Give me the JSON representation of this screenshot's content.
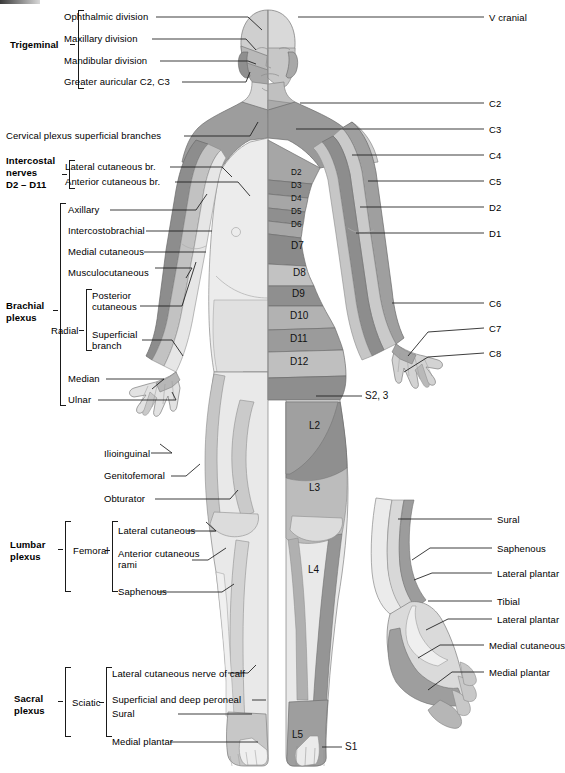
{
  "figure": {
    "colors": {
      "ink": "#1a1a1a",
      "skin_light": "#eeeeee",
      "tone1": "#e3e3e3",
      "tone2": "#cfcfcf",
      "tone3": "#b4b4b4",
      "tone4": "#9a9a9a",
      "tone5": "#8a8a8a",
      "outline": "#6f6f6f"
    }
  },
  "left_groups": [
    {
      "name": "trigeminal",
      "heading": "Trigeminal",
      "bold": true,
      "items": [
        {
          "label": "Ophthalmic division"
        },
        {
          "label": "Maxillary division"
        },
        {
          "label": "Mandibular division"
        },
        {
          "label": "Greater auricular C2, C3"
        }
      ]
    },
    {
      "name": "cervical-plexus",
      "heading": "Cervical plexus",
      "heading_suffix": "superficial branches",
      "bold": true,
      "items": []
    },
    {
      "name": "intercostal-nerves",
      "heading": "Intercostal nerves D2 – D11",
      "heading_lines": [
        "Intercostal",
        "nerves",
        "D2 – D11"
      ],
      "bold": true,
      "items": [
        {
          "label": "Lateral cutaneous br."
        },
        {
          "label": "Anterior cutaneous br."
        }
      ]
    },
    {
      "name": "brachial-plexus",
      "heading": "Brachial plexus",
      "heading_lines": [
        "Brachial",
        "plexus"
      ],
      "bold": true,
      "items": [
        {
          "label": "Axillary"
        },
        {
          "label": "Intercostobrachial"
        },
        {
          "label": "Medial cutaneous"
        },
        {
          "label": "Musculocutaneous"
        },
        {
          "label": "Median"
        },
        {
          "label": "Ulnar"
        }
      ],
      "sub": {
        "name": "radial",
        "heading": "Radial",
        "items": [
          {
            "label_lines": [
              "Posterior",
              "cutaneous"
            ]
          },
          {
            "label_lines": [
              "Superficial",
              "branch"
            ]
          }
        ]
      }
    },
    {
      "name": "lumbar-plexus",
      "heading": "Lumbar plexus",
      "heading_lines": [
        "Lumbar",
        "plexus"
      ],
      "bold": true,
      "loose_items": [
        {
          "label": "Ilioinguinal"
        },
        {
          "label": "Genitofemoral"
        },
        {
          "label": "Obturator"
        }
      ],
      "items": [
        {
          "label": "Lateral cutaneous"
        },
        {
          "label_lines": [
            "Anterior cutaneous",
            "rami"
          ]
        },
        {
          "label": "Saphenous"
        }
      ],
      "sub": {
        "name": "femoral",
        "heading": "Femoral"
      }
    },
    {
      "name": "sacral-plexus",
      "heading": "Sacral plexus",
      "heading_lines": [
        "Sacral",
        "plexus"
      ],
      "bold": true,
      "items": [
        {
          "label": "Lateral cutaneous nerve of calf"
        },
        {
          "label": "Superficial and deep peroneal"
        },
        {
          "label": "Sural"
        },
        {
          "label": "Medial plantar"
        }
      ],
      "sub": {
        "name": "sciatic",
        "heading": "Sciatic"
      }
    }
  ],
  "right_labels": [
    {
      "name": "v-cranial",
      "label": "V cranial",
      "y": 17
    },
    {
      "name": "c2",
      "label": "C2",
      "y": 103
    },
    {
      "name": "c3",
      "label": "C3",
      "y": 129
    },
    {
      "name": "c4",
      "label": "C4",
      "y": 155
    },
    {
      "name": "c5",
      "label": "C5",
      "y": 181
    },
    {
      "name": "d2-right",
      "label": "D2",
      "y": 207
    },
    {
      "name": "d1-right",
      "label": "D1",
      "y": 233
    },
    {
      "name": "c6",
      "label": "C6",
      "y": 303
    },
    {
      "name": "c7",
      "label": "C7",
      "y": 328
    },
    {
      "name": "c8",
      "label": "C8",
      "y": 353
    },
    {
      "name": "sural",
      "label": "Sural",
      "y": 519
    },
    {
      "name": "saphenous-right",
      "label": "Saphenous",
      "y": 548
    },
    {
      "name": "lateral-plantar-upper",
      "label": "Lateral plantar",
      "y": 573
    },
    {
      "name": "tibial",
      "label": "Tibial",
      "y": 601
    },
    {
      "name": "lateral-plantar-lower",
      "label": "Lateral plantar",
      "y": 619
    },
    {
      "name": "medial-cutaneous-right",
      "label": "Medial cutaneous",
      "y": 645
    },
    {
      "name": "medial-plantar-right",
      "label": "Medial plantar",
      "y": 672
    }
  ],
  "body_segments": [
    {
      "name": "d2",
      "label": "D2",
      "x": 291,
      "y": 173,
      "size": "sm"
    },
    {
      "name": "d3",
      "label": "D3",
      "x": 291,
      "y": 186,
      "size": "sm"
    },
    {
      "name": "d4",
      "label": "D4",
      "x": 291,
      "y": 199,
      "size": "sm"
    },
    {
      "name": "d5",
      "label": "D5",
      "x": 291,
      "y": 212,
      "size": "sm"
    },
    {
      "name": "d6",
      "label": "D6",
      "x": 291,
      "y": 225,
      "size": "sm"
    },
    {
      "name": "d7",
      "label": "D7",
      "x": 291,
      "y": 246,
      "size": "lg"
    },
    {
      "name": "d8",
      "label": "D8",
      "x": 293,
      "y": 273,
      "size": "lg"
    },
    {
      "name": "d9",
      "label": "D9",
      "x": 292,
      "y": 294,
      "size": "lg"
    },
    {
      "name": "d10",
      "label": "D10",
      "x": 290,
      "y": 316,
      "size": "lg"
    },
    {
      "name": "d11",
      "label": "D11",
      "x": 290,
      "y": 339,
      "size": "lg"
    },
    {
      "name": "d12",
      "label": "D12",
      "x": 290,
      "y": 362,
      "size": "lg"
    },
    {
      "name": "l2",
      "label": "L2",
      "x": 309,
      "y": 426,
      "size": "lg"
    },
    {
      "name": "l3",
      "label": "L3",
      "x": 309,
      "y": 488,
      "size": "lg"
    },
    {
      "name": "l4",
      "label": "L4",
      "x": 308,
      "y": 570,
      "size": "lg"
    },
    {
      "name": "l5",
      "label": "L5",
      "x": 292,
      "y": 735,
      "size": "lg"
    },
    {
      "name": "s2-3",
      "label": "S2, 3",
      "x": 365,
      "y": 396,
      "size": "lg"
    },
    {
      "name": "s1",
      "label": "S1",
      "x": 345,
      "y": 747,
      "size": "lg"
    }
  ]
}
